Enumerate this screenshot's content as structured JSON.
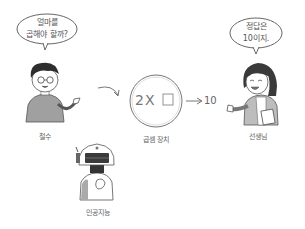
{
  "scene": {
    "title": "Multiplication device problem",
    "characters": [
      {
        "id": "boy",
        "name": "철수",
        "speech": [
          "얼마를",
          "곱해야 할까?"
        ]
      },
      {
        "id": "teacher",
        "name": "선생님",
        "speech": [
          "정답은",
          "10이지."
        ]
      },
      {
        "id": "robot",
        "name": "인공지능"
      }
    ],
    "machine": {
      "label": "곱셈 장치",
      "expression": "2X",
      "blank_symbol": "□",
      "output": "10"
    },
    "colors": {
      "line": "#666666",
      "hair": "#333333",
      "sweater": "#9a9a9a",
      "jacket": "#bdbdbd",
      "background": "#ffffff"
    }
  }
}
